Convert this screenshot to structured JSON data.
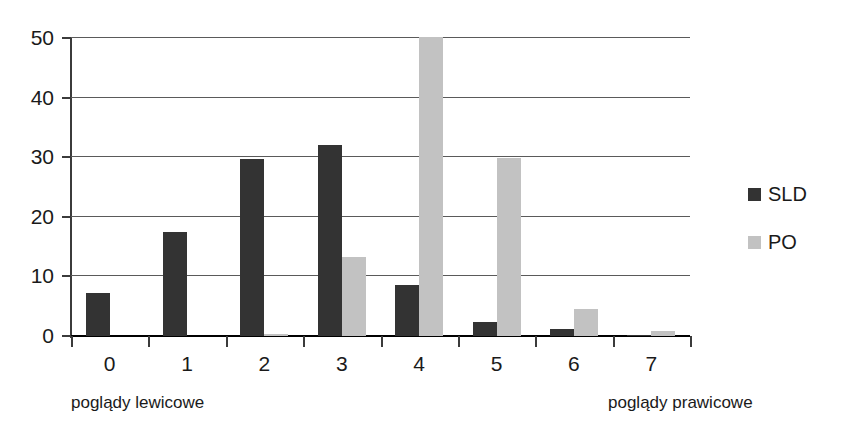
{
  "chart_data": {
    "type": "bar",
    "title": "",
    "subtitle": "",
    "xlabel": "",
    "ylabel": "",
    "categories": [
      "0",
      "1",
      "2",
      "3",
      "4",
      "5",
      "6",
      "7"
    ],
    "series": [
      {
        "name": "SLD",
        "color": "#333333",
        "values": [
          7.2,
          17.5,
          29.7,
          32.1,
          8.5,
          2.3,
          1.2,
          0.2
        ]
      },
      {
        "name": "PO",
        "color": "#c2c2c2",
        "values": [
          0,
          0,
          0.4,
          13.3,
          50.2,
          29.8,
          4.5,
          0.8
        ]
      }
    ],
    "ylim": [
      0,
      50
    ],
    "yticks": [
      0,
      10,
      20,
      30,
      40,
      50
    ],
    "ytick_labels": [
      "0",
      "10",
      "20",
      "30",
      "40",
      "50"
    ],
    "grid": "horizontal",
    "legend_position": "right",
    "annotations": {
      "axis_left_caption": "poglądy lewicowe",
      "axis_right_caption": "poglądy prawicowe"
    }
  },
  "legend": {
    "entries": [
      {
        "label": "SLD",
        "swatch_color": "#333333"
      },
      {
        "label": "PO",
        "swatch_color": "#c2c2c2"
      }
    ]
  },
  "colors": {
    "background": "#ffffff",
    "axis": "#3b3b3b",
    "gridline": "#5a5a5a",
    "text": "#1a1a1a",
    "series_sld": "#333333",
    "series_po": "#c2c2c2"
  }
}
